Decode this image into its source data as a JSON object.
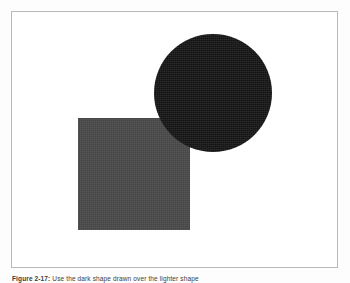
{
  "page": {
    "background_color": "#fdfdfd",
    "width": 350,
    "height": 283
  },
  "figure": {
    "panel": {
      "border_color": "#b9b9b9",
      "background_color": "#ffffff"
    },
    "shapes": [
      {
        "name": "square",
        "fill": "#4a4a4a",
        "left": 77,
        "top": 117,
        "width": 112,
        "height": 112,
        "z": 1
      },
      {
        "name": "circle",
        "fill": "#151515",
        "center_x": 213,
        "center_y": 91,
        "diameter": 118,
        "z": 2
      }
    ],
    "caption": {
      "label": "Figure 2-17:",
      "text": "Use the dark shape drawn over the lighter shape"
    }
  }
}
